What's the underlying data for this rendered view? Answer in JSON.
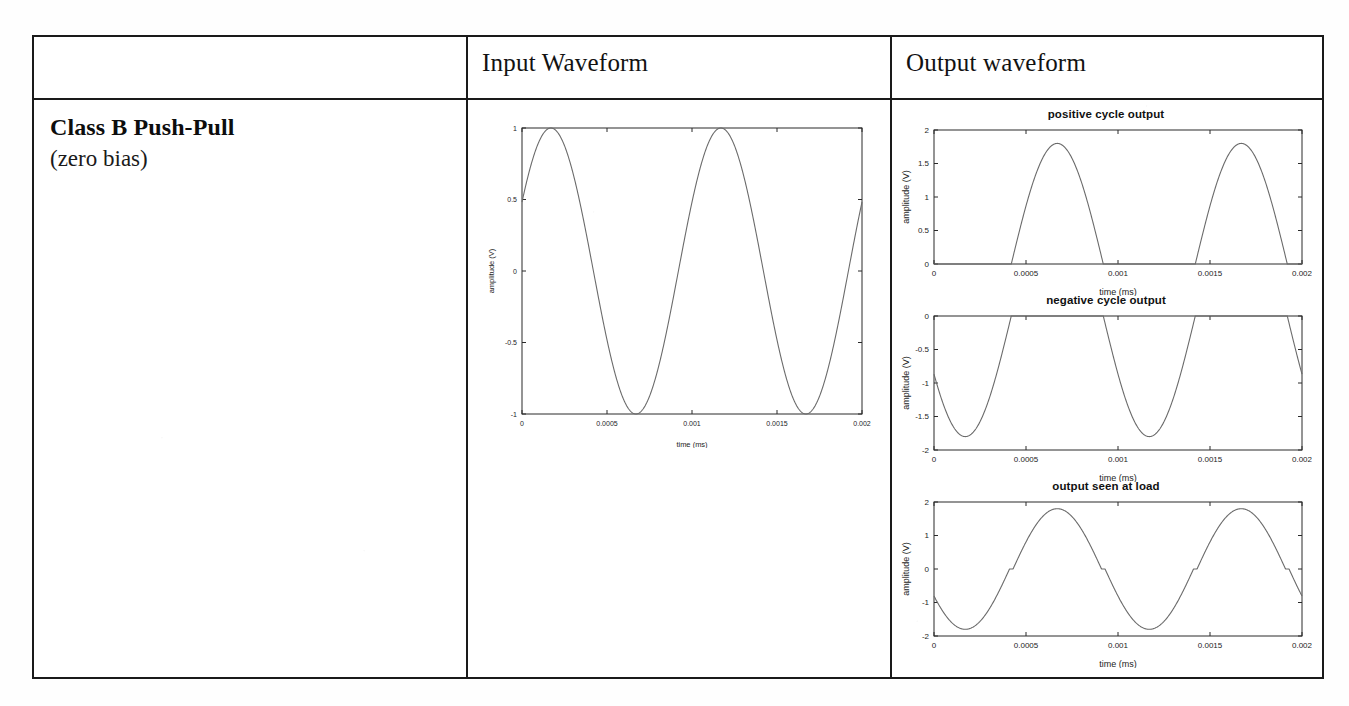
{
  "document": {
    "type": "scanned-table",
    "background_color": "#fefefe",
    "border_color": "#1a1a1a"
  },
  "table": {
    "headers": {
      "col1": "",
      "col2": "Input Waveform",
      "col3": "Output waveform"
    },
    "row": {
      "label_title": "Class B Push-Pull",
      "label_subtitle": "(zero bias)"
    }
  },
  "chart_data": [
    {
      "id": "input-waveform",
      "type": "line",
      "title": "",
      "xlabel": "time (ms)",
      "ylabel": "amplitude (V)",
      "xlim": [
        0,
        0.002
      ],
      "ylim": [
        -1,
        1
      ],
      "xticks": [
        0,
        0.0005,
        0.001,
        0.0015,
        0.002
      ],
      "xticklabels": [
        "0",
        "0.0005",
        "0.001",
        "0.0015",
        "0.002"
      ],
      "yticks": [
        -1,
        -0.5,
        0,
        0.5,
        1
      ],
      "yticklabels": [
        "-1",
        "-0.5",
        "0",
        "0.5",
        "1"
      ],
      "grid": false,
      "legend": "none",
      "series": [
        {
          "name": "input sine",
          "waveform": "sine",
          "amplitude": 1,
          "period": 0.001,
          "phase_fraction": 0.08,
          "offset": 0,
          "color": "#6b6b6b"
        }
      ]
    },
    {
      "id": "positive-cycle-output",
      "type": "line",
      "title": "positive cycle output",
      "xlabel": "time (ms)",
      "ylabel": "amplitude (V)",
      "xlim": [
        0,
        0.002
      ],
      "ylim": [
        0,
        2
      ],
      "xticks": [
        0,
        0.0005,
        0.001,
        0.0015,
        0.002
      ],
      "xticklabels": [
        "0",
        "0.0005",
        "0.001",
        "0.0015",
        "0.002"
      ],
      "yticks": [
        0,
        0.5,
        1,
        1.5,
        2
      ],
      "yticklabels": [
        "0",
        "0.5",
        "1",
        "1.5",
        "2"
      ],
      "grid": false,
      "legend": "none",
      "series": [
        {
          "name": "positive half cycles",
          "waveform": "half-rectified-positive",
          "amplitude": 1.8,
          "period": 0.001,
          "phase_fraction": 0.08,
          "inverted": true,
          "color": "#6b6b6b"
        }
      ]
    },
    {
      "id": "negative-cycle-output",
      "type": "line",
      "title": "negative cycle output",
      "xlabel": "time (ms)",
      "ylabel": "amplitude (V)",
      "xlim": [
        0,
        0.002
      ],
      "ylim": [
        -2,
        0
      ],
      "xticks": [
        0,
        0.0005,
        0.001,
        0.0015,
        0.002
      ],
      "xticklabels": [
        "0",
        "0.0005",
        "0.001",
        "0.0015",
        "0.002"
      ],
      "yticks": [
        -2,
        -1.5,
        -1,
        -0.5,
        0
      ],
      "yticklabels": [
        "-2",
        "-1.5",
        "-1",
        "-0.5",
        "0"
      ],
      "grid": false,
      "legend": "none",
      "series": [
        {
          "name": "negative half cycles",
          "waveform": "half-rectified-negative",
          "amplitude": 1.8,
          "period": 0.001,
          "phase_fraction": 0.08,
          "inverted": true,
          "color": "#6b6b6b"
        }
      ]
    },
    {
      "id": "output-seen-at-load",
      "type": "line",
      "title": "output seen at load",
      "xlabel": "time (ms)",
      "ylabel": "amplitude (V)",
      "xlim": [
        0,
        0.002
      ],
      "ylim": [
        -2,
        2
      ],
      "xticks": [
        0,
        0.0005,
        0.001,
        0.0015,
        0.002
      ],
      "xticklabels": [
        "0",
        "0.0005",
        "0.001",
        "0.0015",
        "0.002"
      ],
      "yticks": [
        -2,
        -1,
        0,
        1,
        2
      ],
      "yticklabels": [
        "-2",
        "-1",
        "0",
        "1",
        "2"
      ],
      "grid": false,
      "legend": "none",
      "series": [
        {
          "name": "combined output with crossover distortion",
          "waveform": "sine-with-crossover-distortion",
          "amplitude": 1.8,
          "period": 0.001,
          "phase_fraction": 0.08,
          "inverted": true,
          "crossover_deadband": 0.06,
          "color": "#6b6b6b"
        }
      ]
    }
  ]
}
